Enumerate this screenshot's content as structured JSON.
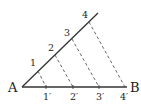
{
  "diagram": {
    "points": {
      "A": {
        "label": "A"
      },
      "B": {
        "label": "B"
      }
    },
    "ray_marks": [
      {
        "label": "1"
      },
      {
        "label": "2"
      },
      {
        "label": "3"
      },
      {
        "label": "4"
      }
    ],
    "segment_marks": [
      {
        "label": "1′"
      },
      {
        "label": "2′"
      },
      {
        "label": "3′"
      },
      {
        "label": "4′"
      }
    ],
    "colors": {
      "line": "#333333",
      "dashed": "#555555",
      "background": "#ffffff"
    }
  }
}
